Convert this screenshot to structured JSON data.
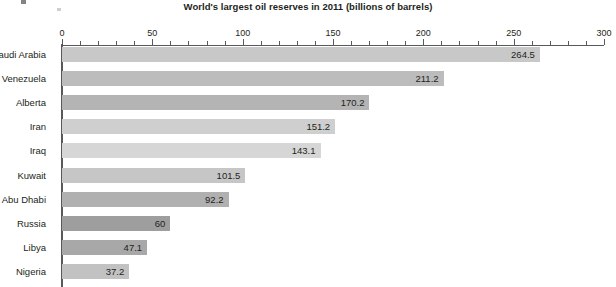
{
  "chart_data": {
    "type": "bar",
    "orientation": "horizontal",
    "title": "World's largest oil reserves in 2011 (billions of barrels)",
    "xlabel": "",
    "ylabel": "",
    "xlim": [
      0,
      300
    ],
    "grid": false,
    "legend": null,
    "major_tick_step": 50,
    "minor_tick_step": 10,
    "tick_labels": [
      "0",
      "50",
      "100",
      "150",
      "200",
      "250",
      "300"
    ],
    "tick_values": [
      0,
      50,
      100,
      150,
      200,
      250,
      300
    ],
    "categories": [
      "Saudi Arabia",
      "Venezuela",
      "Alberta",
      "Iran",
      "Iraq",
      "Kuwait",
      "Abu Dhabi",
      "Russia",
      "Libya",
      "Nigeria"
    ],
    "values": [
      264.5,
      211.2,
      170.2,
      151.2,
      143.1,
      101.5,
      92.2,
      60,
      47.1,
      37.2
    ],
    "value_labels": [
      "264.5",
      "211.2",
      "170.2",
      "151.2",
      "143.1",
      "101.5",
      "92.2",
      "60",
      "47.1",
      "37.2"
    ],
    "bar_colors": [
      "#c8c8c8",
      "#bcbcbc",
      "#b4b4b4",
      "#cfcfcf",
      "#d6d6d6",
      "#c6c6c6",
      "#b0b0b0",
      "#9e9e9e",
      "#a8a8a8",
      "#c2c2c2"
    ],
    "axis_color": "#58595b",
    "text_color": "#231f20",
    "background_color": "#ffffff"
  }
}
